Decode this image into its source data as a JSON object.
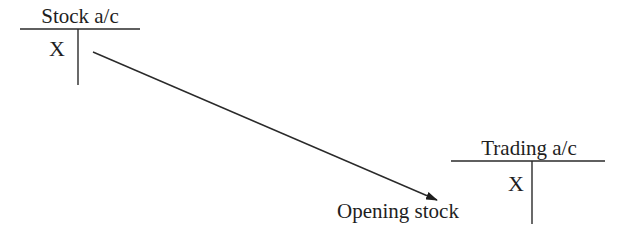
{
  "diagram": {
    "accounts": [
      {
        "id": "stock",
        "title": "Stock a/c",
        "debit_entry": "X"
      },
      {
        "id": "trading",
        "title": "Trading a/c",
        "debit_entry": "X"
      }
    ],
    "arrow": {
      "from": "stock",
      "to": "trading",
      "label": "Opening stock"
    }
  }
}
